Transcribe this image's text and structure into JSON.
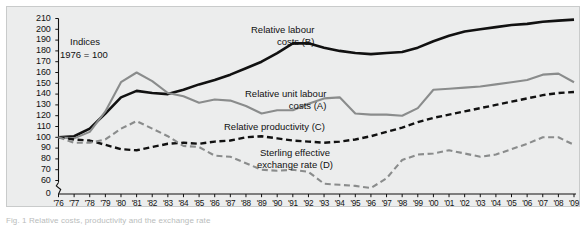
{
  "figure": {
    "caption": "Fig. 1  Relative costs, productivity and the exchange rate",
    "annotation_line1": "Indices",
    "annotation_line2": "1976 = 100"
  },
  "chart_data": {
    "type": "line",
    "title": "",
    "subtitle": "",
    "xlabel": "",
    "ylabel": "",
    "ylim": [
      60,
      210
    ],
    "ytick_step": 10,
    "axis_break_value": 0,
    "grid": false,
    "legend_position": "inline-annotations",
    "yticks": [
      "210",
      "200",
      "190",
      "180",
      "170",
      "160",
      "150",
      "140",
      "130",
      "120",
      "110",
      "100",
      "90",
      "80",
      "70",
      "60",
      "0"
    ],
    "x": [
      "'76",
      "'77",
      "'78",
      "'79",
      "'80",
      "'81",
      "'82",
      "'83",
      "'84",
      "'85",
      "'86",
      "'87",
      "'88",
      "'89",
      "'90",
      "'91",
      "'92",
      "'93",
      "'94",
      "'95",
      "'96",
      "'97",
      "'98",
      "'99",
      "'00",
      "'01",
      "'02",
      "'03",
      "'04",
      "'05",
      "'06",
      "'07",
      "'08",
      "'09"
    ],
    "series": [
      {
        "name": "Relative labour costs (B)",
        "key": "B",
        "label_line1": "Relative labour",
        "label_line2": "costs (B)",
        "color": "#111111",
        "style": "solid",
        "width": 2.6,
        "values": [
          100,
          101,
          108,
          122,
          137,
          143,
          141,
          140,
          144,
          149,
          153,
          158,
          164,
          170,
          178,
          187,
          187,
          183,
          180,
          178,
          177,
          178,
          179,
          183,
          189,
          194,
          198,
          200,
          202,
          204,
          205,
          207,
          208,
          209
        ]
      },
      {
        "name": "Relative unit labour costs (A)",
        "key": "A",
        "label_line1": "Relative unit labour",
        "label_line2": "costs (A)",
        "color": "#8a8c8c",
        "style": "solid",
        "width": 2.1,
        "values": [
          100,
          99,
          105,
          124,
          151,
          160,
          152,
          141,
          138,
          132,
          135,
          134,
          129,
          122,
          125,
          125,
          131,
          136,
          137,
          122,
          121,
          121,
          120,
          127,
          144,
          145,
          146,
          147,
          149,
          151,
          153,
          158,
          159,
          151
        ]
      },
      {
        "name": "Relative productivity (C)",
        "key": "C",
        "label_line1": "Relative productivity (C)",
        "label_line2": "",
        "color": "#111111",
        "style": "dashed",
        "width": 2.4,
        "values": [
          100,
          98,
          97,
          93,
          89,
          88,
          91,
          94,
          95,
          94,
          96,
          97,
          100,
          101,
          99,
          97,
          96,
          95,
          96,
          98,
          101,
          105,
          109,
          114,
          118,
          121,
          124,
          127,
          130,
          133,
          136,
          139,
          141,
          142
        ]
      },
      {
        "name": "Sterling effective exchange rate (D)",
        "key": "D",
        "label_line1": "Sterling effective",
        "label_line2": "exchange rate (D)",
        "color": "#8a8c8c",
        "style": "dashed",
        "width": 2.1,
        "values": [
          100,
          95,
          95,
          98,
          108,
          115,
          108,
          101,
          92,
          91,
          83,
          82,
          76,
          70,
          69,
          70,
          68,
          57,
          56,
          55,
          53,
          62,
          79,
          84,
          85,
          88,
          85,
          82,
          84,
          89,
          94,
          100,
          100,
          93
        ]
      }
    ]
  }
}
